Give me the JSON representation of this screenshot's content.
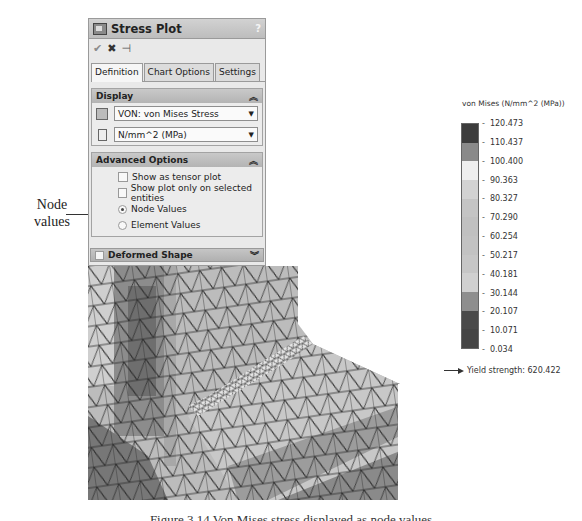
{
  "annotation": {
    "label": "Node values"
  },
  "panel": {
    "title": "Stress Plot",
    "help": "?",
    "actions": {
      "ok": "✔",
      "cancel": "✖",
      "pin": "⊣"
    },
    "tabs": [
      {
        "label": "Definition",
        "active": true
      },
      {
        "label": "Chart Options",
        "active": false
      },
      {
        "label": "Settings",
        "active": false
      }
    ],
    "display": {
      "header": "Display",
      "collapse_icon": "≈",
      "component": "VON: von Mises Stress",
      "units": "N/mm^2 (MPa)"
    },
    "advanced": {
      "header": "Advanced Options",
      "collapse_icon": "≈",
      "show_tensor": {
        "label": "Show as tensor plot",
        "checked": false
      },
      "show_selected": {
        "label": "Show plot only on selected entities",
        "checked": false
      },
      "node_values": {
        "label": "Node Values",
        "selected": true
      },
      "element_values": {
        "label": "Element Values",
        "selected": false
      }
    },
    "deformed": {
      "label": "Deformed Shape",
      "checked": false,
      "expand_icon": "≈"
    }
  },
  "legend": {
    "title": "von Mises (N/mm^2 (MPa))",
    "ticks": [
      "120.473",
      "110.437",
      "100.400",
      "90.363",
      "80.327",
      "70.290",
      "60.254",
      "50.217",
      "40.181",
      "30.144",
      "20.107",
      "10.071",
      "0.034"
    ],
    "band_colors": [
      "#3c3c3c",
      "#8a8a8a",
      "#efefef",
      "#d2d2d2",
      "#c4c4c4",
      "#c0c0c0",
      "#c2c2c2",
      "#c6c6c6",
      "#d0d0d0",
      "#8e8e8e",
      "#4a4a4a",
      "#454545"
    ],
    "yield_label": "Yield strength: 620.422"
  },
  "chart_data": {
    "type": "heatmap",
    "title": "von Mises (N/mm^2 (MPa))",
    "colorbar_ticks": [
      120.473,
      110.437,
      100.4,
      90.363,
      80.327,
      70.29,
      60.254,
      50.217,
      40.181,
      30.144,
      20.107,
      10.071,
      0.034
    ],
    "range": [
      0.034,
      120.473
    ],
    "annotations": [
      "Yield strength: 620.422"
    ]
  },
  "caption": "Figure 3.14 Von Mises stress displayed as node values"
}
